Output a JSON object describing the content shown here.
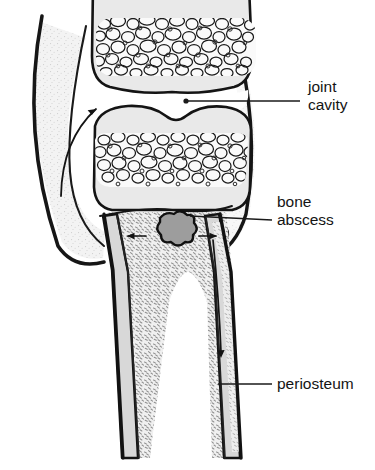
{
  "figure": {
    "background_color": "#ffffff",
    "width": 375,
    "height": 470
  },
  "labels": [
    {
      "id": "joint-cavity",
      "line1": "joint",
      "line2": "cavity",
      "text": "joint cavity",
      "x": 308,
      "y": 92,
      "leader_from_x": 300,
      "leader_to_x": 185,
      "leader_y": 101,
      "dot": true
    },
    {
      "id": "bone-abscess",
      "line1": "bone",
      "line2": "abscess",
      "text": "bone abscess",
      "x": 277,
      "y": 207,
      "leader_from_x": 272,
      "leader_to_x": 180,
      "leader_y": 216,
      "dot": false
    },
    {
      "id": "periosteum",
      "line1": "periosteum",
      "line2": "",
      "text": "periosteum",
      "x": 277,
      "y": 388,
      "leader_from_x": 272,
      "leader_to_x": 218,
      "leader_y": 384,
      "dot": false
    }
  ],
  "structures": {
    "upper_epiphysis": "upper bone end with cancellous bone",
    "lower_epiphysis": "lower bone end with cancellous bone",
    "joint_cavity": "space between the two articular surfaces",
    "joint_capsule": "thick outer curved membrane enclosing the joint",
    "growth_plate": "epiphyseal line below the lower epiphysis",
    "abscess": "dark irregular lobed cavity in the metaphysis",
    "metaphysis": "stippled spongy bone region below the growth plate",
    "medullary_cavity": "white marrow space inside the shaft",
    "cortical_bone": "dense outer walls of the shaft",
    "periosteum": "thin outer membrane layer along the shaft",
    "subperiosteal_space": "pale strip between cortex and periosteum on the right"
  },
  "arrows": [
    {
      "id": "capsule-spread-arrow",
      "direction": "up-right",
      "meaning": "pus tracking into the joint cavity"
    },
    {
      "id": "abscess-left-arrow",
      "direction": "left",
      "meaning": "abscess spreading laterally"
    },
    {
      "id": "abscess-right-arrow",
      "direction": "right",
      "meaning": "abscess spreading laterally"
    },
    {
      "id": "subperiosteal-arrow",
      "direction": "down",
      "meaning": "pus tracking down beneath the periosteum"
    }
  ],
  "colors": {
    "outline": "#1a1a1a",
    "bone_fill": "#e8e8e8",
    "cancellous_fill": "#fbfbfb",
    "stipple": "#9a9a9a",
    "abscess_fill": "#9c9c9c",
    "capsule": "#161616",
    "label_text": "#141414",
    "background": "#ffffff"
  }
}
